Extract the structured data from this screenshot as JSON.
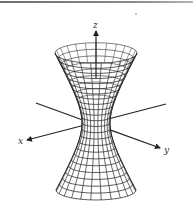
{
  "figure": {
    "width": 193,
    "height": 213,
    "colors": {
      "line": "#222222",
      "mesh": "#2a2a2a",
      "label": "#333333",
      "rule": "#7a7a7a"
    }
  },
  "axes": {
    "x": {
      "label": "x",
      "label_pos": [
        18,
        144
      ],
      "from": [
        166,
        104
      ],
      "to": [
        27,
        140
      ],
      "arrow": true
    },
    "y": {
      "label": "y",
      "label_pos": [
        164,
        153
      ],
      "from": [
        36,
        103
      ],
      "to": [
        160,
        148
      ],
      "arrow": true
    },
    "z": {
      "label": "z",
      "label_pos": [
        93,
        28
      ],
      "from": [
        96,
        120
      ],
      "to": [
        96,
        31
      ],
      "arrow": true
    }
  },
  "surface": {
    "type": "hyperboloid-one-sheet",
    "center_x": 96,
    "top_y": 53,
    "waist_y": 123,
    "bottom_y": 190,
    "top_rx": 41,
    "waist_rx": 14,
    "bottom_rx": 40,
    "ry_ratio": 0.25,
    "rings_upper": 12,
    "rings_lower": 11,
    "meridians": 24
  }
}
